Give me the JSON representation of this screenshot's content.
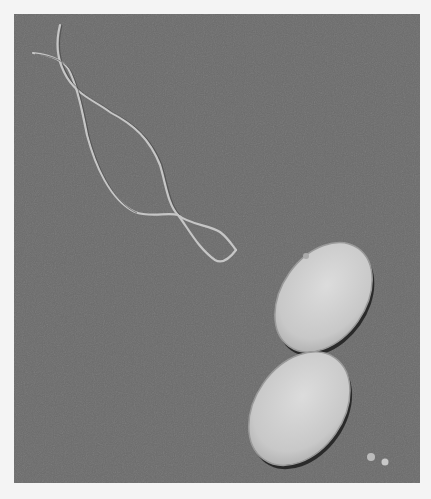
{
  "image": {
    "subject": "micrograph of a dividing rod-shaped bacterium with flagella",
    "background_color": "#6b6b6b",
    "border_color": "#f4f4f4",
    "cell_color": "#d2d2d2",
    "flagella_color": "#c8c8c8",
    "outline_color": "#2a2a2a"
  }
}
